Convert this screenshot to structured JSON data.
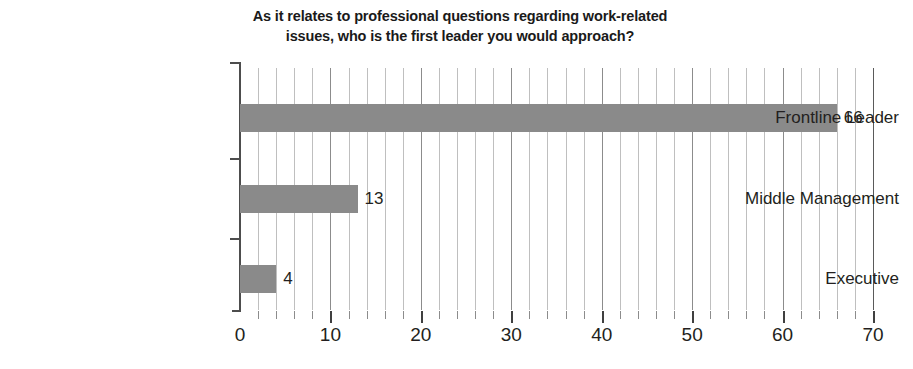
{
  "chart_data": {
    "type": "bar",
    "orientation": "horizontal",
    "title": "As it relates to professional questions regarding work-related issues, who is the first leader you would approach?",
    "title_lines": [
      "As it relates to professional questions regarding work-related",
      "issues, who is the first leader you would approach?"
    ],
    "categories": [
      "Frontline Leader",
      "Middle Management",
      "Executive"
    ],
    "values": [
      66,
      13,
      4
    ],
    "value_labels": [
      "66",
      "13",
      "4"
    ],
    "xlabel": "",
    "ylabel": "",
    "xlim": [
      0,
      70
    ],
    "xticks": [
      0,
      10,
      20,
      30,
      40,
      50,
      60,
      70
    ],
    "xtick_labels": [
      "0",
      "10",
      "20",
      "30",
      "40",
      "50",
      "60",
      "70"
    ],
    "minor_tick_interval": 2,
    "grid": "vertical-only",
    "legend": "none",
    "bar_color": "#8a8a8a",
    "gridline_color": "#bfbfbf",
    "axis_color": "#4d4d4d",
    "background": "#ffffff"
  }
}
